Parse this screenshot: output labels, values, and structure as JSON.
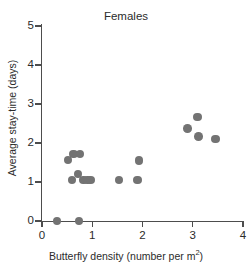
{
  "chart_data": {
    "type": "scatter",
    "title": "Females",
    "xlabel_text": "Butterfly density (number per m",
    "xlabel_sup": "2",
    "xlabel_tail": ")",
    "xlabel": "Butterfly density (number per m2)",
    "ylabel": "Average stay-time (days)",
    "xlim": [
      0,
      4
    ],
    "ylim": [
      0,
      5
    ],
    "xticks": [
      0,
      1,
      2,
      3,
      4
    ],
    "yticks": [
      0,
      1,
      2,
      3,
      4,
      5
    ],
    "xtick_labels": [
      "0",
      "1",
      "2",
      "3",
      "4"
    ],
    "ytick_labels": [
      "0",
      "1",
      "2",
      "3",
      "4",
      "5"
    ],
    "grid": false,
    "legend": false,
    "marker_color": "#737373",
    "marker_shape": "circle",
    "axis_color": "#4d4d4d",
    "points": [
      {
        "x": 0.3,
        "y": 0.0
      },
      {
        "x": 0.74,
        "y": 0.0
      },
      {
        "x": 0.52,
        "y": 1.56
      },
      {
        "x": 0.63,
        "y": 1.72
      },
      {
        "x": 0.76,
        "y": 1.72
      },
      {
        "x": 0.6,
        "y": 1.05
      },
      {
        "x": 0.72,
        "y": 1.2
      },
      {
        "x": 0.82,
        "y": 1.05
      },
      {
        "x": 0.9,
        "y": 1.05
      },
      {
        "x": 0.96,
        "y": 1.05
      },
      {
        "x": 1.53,
        "y": 1.05
      },
      {
        "x": 1.9,
        "y": 1.05
      },
      {
        "x": 1.93,
        "y": 1.55
      },
      {
        "x": 2.9,
        "y": 2.37
      },
      {
        "x": 3.1,
        "y": 2.67
      },
      {
        "x": 3.12,
        "y": 2.16
      },
      {
        "x": 3.45,
        "y": 2.1
      }
    ]
  }
}
